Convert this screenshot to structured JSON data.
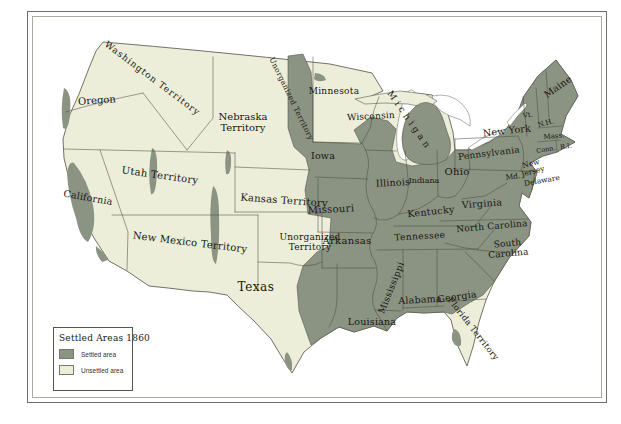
{
  "colors": {
    "settled": "#8b9383",
    "unsettled": "#eceeda",
    "line": "#4f4f46",
    "background": "#ffffff",
    "frame_outer": "#6e6e68",
    "frame_inner": "#aaaaa2"
  },
  "legend": {
    "title": "Settled Areas 1860",
    "items": [
      {
        "label": "Settled area",
        "type": "settled"
      },
      {
        "label": "Unsettled area",
        "type": "unsettled"
      }
    ]
  },
  "map": {
    "labels": [
      {
        "text": "Washington Territory",
        "x": 152,
        "y": 79,
        "r": 37,
        "s": 9,
        "ls": 1
      },
      {
        "text": "Oregon",
        "x": 97,
        "y": 101,
        "r": -4,
        "s": 10,
        "ls": 0
      },
      {
        "text": "Nebraska\nTerritory",
        "x": 243,
        "y": 123,
        "r": 0,
        "s": 10,
        "ls": 0
      },
      {
        "text": "Unorganized Territory",
        "x": 291,
        "y": 99,
        "r": 64,
        "s": 7.5,
        "ls": 0.3
      },
      {
        "text": "Minnesota",
        "x": 334,
        "y": 92,
        "r": 0,
        "s": 9,
        "ls": 0.3
      },
      {
        "text": "Wisconsin",
        "x": 371,
        "y": 117,
        "r": -3,
        "s": 9,
        "ls": 0.2
      },
      {
        "text": "Michigan",
        "x": 409,
        "y": 121,
        "r": 55,
        "s": 9,
        "ls": 3.5
      },
      {
        "text": "Iowa",
        "x": 323,
        "y": 156,
        "r": 0,
        "s": 9.5,
        "ls": 0.2
      },
      {
        "text": "Illinois",
        "x": 393,
        "y": 183,
        "r": -3,
        "s": 9.5,
        "ls": 0.2
      },
      {
        "text": "Indiana",
        "x": 424,
        "y": 181,
        "r": 0,
        "s": 8,
        "ls": 0
      },
      {
        "text": "Ohio",
        "x": 457,
        "y": 172,
        "r": 0,
        "s": 10,
        "ls": 0.3
      },
      {
        "text": "New York",
        "x": 507,
        "y": 131,
        "r": -6,
        "s": 9.5,
        "ls": 0.2
      },
      {
        "text": "Pennsylvania",
        "x": 489,
        "y": 154,
        "r": -7,
        "s": 9,
        "ls": 0.2
      },
      {
        "text": "Maine",
        "x": 558,
        "y": 87,
        "r": -35,
        "s": 9.5,
        "ls": 0.2
      },
      {
        "text": "Vt.",
        "x": 528,
        "y": 116,
        "r": -10,
        "s": 7,
        "ls": 0
      },
      {
        "text": "N.H.",
        "x": 546,
        "y": 124,
        "r": -15,
        "s": 7,
        "ls": 0
      },
      {
        "text": "Mass.",
        "x": 554,
        "y": 137,
        "r": -5,
        "s": 7,
        "ls": 0
      },
      {
        "text": "Conn.",
        "x": 546,
        "y": 150,
        "r": -10,
        "s": 6.5,
        "ls": 0
      },
      {
        "text": "R.I.",
        "x": 566,
        "y": 147,
        "r": -8,
        "s": 6.5,
        "ls": 0
      },
      {
        "text": "New\nJersey",
        "x": 532,
        "y": 168,
        "r": -15,
        "s": 7.5,
        "ls": 0
      },
      {
        "text": "Delaware",
        "x": 542,
        "y": 181,
        "r": -10,
        "s": 7.5,
        "ls": 0
      },
      {
        "text": "Md.",
        "x": 513,
        "y": 177,
        "r": -8,
        "s": 7.5,
        "ls": 0
      },
      {
        "text": "Utah Territory",
        "x": 160,
        "y": 176,
        "r": 8,
        "s": 10,
        "ls": 0.3
      },
      {
        "text": "California",
        "x": 88,
        "y": 198,
        "r": 10,
        "s": 9.5,
        "ls": 0.2
      },
      {
        "text": "Kansas Territory",
        "x": 284,
        "y": 201,
        "r": 4,
        "s": 10,
        "ls": 0.2
      },
      {
        "text": "Missouri",
        "x": 331,
        "y": 210,
        "r": -3,
        "s": 10,
        "ls": 0.3
      },
      {
        "text": "Kentucky",
        "x": 431,
        "y": 212,
        "r": -6,
        "s": 9.5,
        "ls": 0.3
      },
      {
        "text": "Virginia",
        "x": 482,
        "y": 204,
        "r": -4,
        "s": 9.5,
        "ls": 0.3
      },
      {
        "text": "New Mexico Territory",
        "x": 190,
        "y": 243,
        "r": 7,
        "s": 10,
        "ls": 0.2
      },
      {
        "text": "Unorganized\nTerritory",
        "x": 310,
        "y": 243,
        "r": 0,
        "s": 9,
        "ls": 0.2
      },
      {
        "text": "Arkansas",
        "x": 347,
        "y": 241,
        "r": 0,
        "s": 10,
        "ls": 0.3
      },
      {
        "text": "Tennessee",
        "x": 420,
        "y": 237,
        "r": -3,
        "s": 9,
        "ls": 0.4
      },
      {
        "text": "North Carolina",
        "x": 492,
        "y": 227,
        "r": -5,
        "s": 9,
        "ls": 0.2
      },
      {
        "text": "South\nCarolina",
        "x": 508,
        "y": 249,
        "r": -5,
        "s": 9,
        "ls": 0.2
      },
      {
        "text": "Mississippi",
        "x": 392,
        "y": 288,
        "r": -68,
        "s": 9,
        "ls": 0.4
      },
      {
        "text": "Alabama",
        "x": 420,
        "y": 300,
        "r": -3,
        "s": 9.5,
        "ls": 0.2
      },
      {
        "text": "Georgia",
        "x": 457,
        "y": 297,
        "r": -8,
        "s": 9.5,
        "ls": 0.2
      },
      {
        "text": "Texas",
        "x": 256,
        "y": 287,
        "r": 0,
        "s": 12,
        "ls": 0.5
      },
      {
        "text": "Louisiana",
        "x": 372,
        "y": 322,
        "r": 0,
        "s": 9.5,
        "ls": 0.2
      },
      {
        "text": "Florida Territory",
        "x": 473,
        "y": 329,
        "r": 52,
        "s": 8.5,
        "ls": 0.3
      }
    ]
  }
}
